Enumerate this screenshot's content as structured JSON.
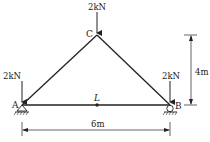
{
  "diagram": {
    "type": "truss",
    "nodes": {
      "A": {
        "label": "A",
        "support": "pin"
      },
      "B": {
        "label": "B",
        "support": "roller"
      },
      "C": {
        "label": "C"
      }
    },
    "members": [
      [
        "A",
        "C"
      ],
      [
        "C",
        "B"
      ],
      [
        "A",
        "B"
      ]
    ],
    "midpoint_label": "L",
    "loads": {
      "C": "2kN",
      "A": "2kN",
      "B": "2kN"
    },
    "dimensions": {
      "height": "4m",
      "span": "6m"
    }
  }
}
